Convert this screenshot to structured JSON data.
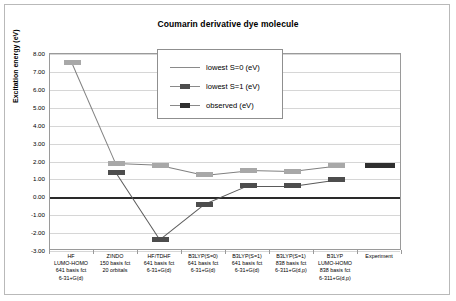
{
  "chart_data": {
    "type": "line",
    "title": "Coumarin derivative dye molecule",
    "xlabel": "",
    "ylabel": "Excitation energy (eV)",
    "ylim": [
      -3.0,
      8.0
    ],
    "ytick_step": 1.0,
    "yticks": [
      "8.00",
      "7.00",
      "6.00",
      "5.00",
      "4.00",
      "3.00",
      "2.00",
      "1.00",
      "0.00",
      "-1.00",
      "-2.00",
      "-3.00"
    ],
    "grid": true,
    "legend_position": "top-center-inside",
    "zero_line": 0.0,
    "categories": [
      "HF LUMO-HOMO 641 basis fct 6-31+G(d)",
      "ZINDO 150 basis fct 20 orbitals",
      "HF/TDHF 641 basis fct 6-31+G(d)",
      "B3LYP(S=0) 641 basis fct 6-31+G(d)",
      "B3LYP(S=1) 641 basis fct 6-31+G(d)",
      "B3LYP(S=1) 838 basis fct 6-311+G(d,p)",
      "B3LYP LUMO-HOMO 838 basis fct 6-311+G(d,p)",
      "Experiment"
    ],
    "category_lines": [
      [
        "HF",
        "LUMO-HOMO",
        "641 basis fct",
        "6-31+G(d)"
      ],
      [
        "ZINDO",
        "150 basis fct",
        "20 orbitals",
        ""
      ],
      [
        "HF/TDHF",
        "641 basis fct",
        "6-31+G(d)",
        ""
      ],
      [
        "B3LYP(S=0)",
        "641 basis fct",
        "6-31+G(d)",
        ""
      ],
      [
        "B3LYP(S=1)",
        "641 basis fct",
        "6-31+G(d)",
        ""
      ],
      [
        "B3LYP(S=1)",
        "838 basis fct",
        "6-311+G(d,p)",
        ""
      ],
      [
        "B3LYP",
        "LUMO-HOMO",
        "838 basis fct",
        "6-311+G(d,p)"
      ],
      [
        "Experiment",
        "",
        "",
        ""
      ]
    ],
    "series": [
      {
        "name": "lowest S=0 (eV)",
        "color": "#a8a8a8",
        "values": [
          7.55,
          1.9,
          1.8,
          1.25,
          1.5,
          1.45,
          1.75,
          null
        ]
      },
      {
        "name": "lowest S=1 (eV)",
        "color": "#4d4d4d",
        "values": [
          null,
          1.4,
          -2.35,
          -0.4,
          0.65,
          0.65,
          1.0,
          null
        ]
      },
      {
        "name": "observed (eV)",
        "color": "#2f2f2f",
        "values": [
          null,
          null,
          null,
          null,
          null,
          null,
          null,
          1.75
        ]
      }
    ]
  },
  "legend": {
    "entries": [
      "lowest S=0 (eV)",
      "lowest S=1 (eV)",
      "observed (eV)"
    ]
  }
}
